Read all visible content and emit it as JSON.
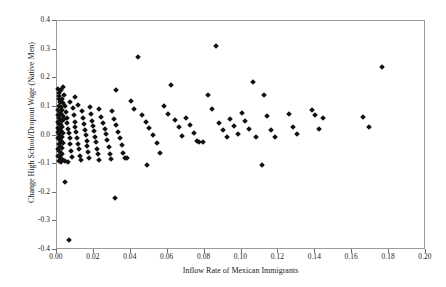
{
  "chart_data": {
    "type": "scatter",
    "title": "",
    "xlabel": "Inflow Rate of Mexican Immigrants",
    "ylabel": "Change High School/Dropout Wage (Native Men)",
    "xlim": [
      0.0,
      0.2
    ],
    "ylim": [
      -0.4,
      0.4
    ],
    "xticks": [
      0.0,
      0.02,
      0.04,
      0.06,
      0.08,
      0.1,
      0.12,
      0.14,
      0.16,
      0.18,
      0.2
    ],
    "xtick_labels": [
      "0.00",
      "0.02",
      "0.04",
      "0.06",
      "0.08",
      "0.10",
      "0.12",
      "0.14",
      "0.16",
      "0.18",
      "0.20"
    ],
    "yticks": [
      -0.4,
      -0.3,
      -0.2,
      -0.1,
      0.0,
      0.1,
      0.2,
      0.3,
      0.4
    ],
    "ytick_labels": [
      "-0.4",
      "-0.3",
      "-0.2",
      "-0.1",
      "0.0",
      "0.1",
      "0.2",
      "0.3",
      "0.4"
    ],
    "grid": false,
    "legend": null,
    "marker": "diamond",
    "marker_color": "#111111",
    "frame_color": "#9a9a9a",
    "series": [
      {
        "name": "metro areas",
        "points": [
          [
            0.0006,
            0.164
          ],
          [
            0.001,
            0.149
          ],
          [
            0.0013,
            0.137
          ],
          [
            0.0009,
            0.126
          ],
          [
            0.0016,
            0.118
          ],
          [
            0.0021,
            0.16
          ],
          [
            0.003,
            0.17
          ],
          [
            0.0026,
            0.128
          ],
          [
            0.0034,
            0.112
          ],
          [
            0.0012,
            0.104
          ],
          [
            0.0019,
            0.098
          ],
          [
            0.0028,
            0.09
          ],
          [
            0.0007,
            0.088
          ],
          [
            0.0015,
            0.08
          ],
          [
            0.0023,
            0.074
          ],
          [
            0.0032,
            0.068
          ],
          [
            0.0004,
            0.072
          ],
          [
            0.0011,
            0.062
          ],
          [
            0.0018,
            0.056
          ],
          [
            0.0025,
            0.05
          ],
          [
            0.0036,
            0.058
          ],
          [
            0.0005,
            0.046
          ],
          [
            0.0013,
            0.04
          ],
          [
            0.0021,
            0.035
          ],
          [
            0.0029,
            0.03
          ],
          [
            0.0008,
            0.026
          ],
          [
            0.0016,
            0.02
          ],
          [
            0.0024,
            0.015
          ],
          [
            0.0033,
            0.01
          ],
          [
            0.0003,
            0.012
          ],
          [
            0.001,
            0.005
          ],
          [
            0.0018,
            0.0
          ],
          [
            0.0027,
            -0.005
          ],
          [
            0.0006,
            -0.008
          ],
          [
            0.0014,
            -0.014
          ],
          [
            0.0022,
            -0.02
          ],
          [
            0.0031,
            -0.026
          ],
          [
            0.0009,
            -0.03
          ],
          [
            0.0017,
            -0.036
          ],
          [
            0.0026,
            -0.042
          ],
          [
            0.0004,
            -0.048
          ],
          [
            0.0012,
            -0.055
          ],
          [
            0.002,
            -0.06
          ],
          [
            0.0029,
            -0.066
          ],
          [
            0.0007,
            -0.07
          ],
          [
            0.0015,
            -0.076
          ],
          [
            0.0023,
            -0.082
          ],
          [
            0.0034,
            -0.086
          ],
          [
            0.0011,
            -0.09
          ],
          [
            0.0019,
            -0.094
          ],
          [
            0.004,
            0.142
          ],
          [
            0.0044,
            0.104
          ],
          [
            0.0048,
            0.082
          ],
          [
            0.0052,
            0.06
          ],
          [
            0.0056,
            0.044
          ],
          [
            0.006,
            0.024
          ],
          [
            0.0064,
            0.008
          ],
          [
            0.0068,
            -0.01
          ],
          [
            0.0072,
            -0.03
          ],
          [
            0.0076,
            -0.054
          ],
          [
            0.008,
            -0.074
          ],
          [
            0.0042,
            -0.088
          ],
          [
            0.0058,
            -0.092
          ],
          [
            0.007,
            0.118
          ],
          [
            0.0085,
            0.096
          ],
          [
            0.009,
            0.07
          ],
          [
            0.0095,
            0.048
          ],
          [
            0.01,
            0.03
          ],
          [
            0.0105,
            0.012
          ],
          [
            0.011,
            -0.008
          ],
          [
            0.0115,
            -0.028
          ],
          [
            0.012,
            -0.048
          ],
          [
            0.0125,
            -0.07
          ],
          [
            0.013,
            -0.086
          ],
          [
            0.0098,
            0.134
          ],
          [
            0.0112,
            0.108
          ],
          [
            0.0135,
            0.086
          ],
          [
            0.014,
            0.062
          ],
          [
            0.0145,
            0.04
          ],
          [
            0.015,
            0.02
          ],
          [
            0.0155,
            0.002
          ],
          [
            0.016,
            -0.018
          ],
          [
            0.0165,
            -0.038
          ],
          [
            0.017,
            -0.058
          ],
          [
            0.0175,
            -0.08
          ],
          [
            0.018,
            0.1
          ],
          [
            0.0185,
            0.074
          ],
          [
            0.019,
            0.052
          ],
          [
            0.0195,
            0.032
          ],
          [
            0.02,
            0.014
          ],
          [
            0.0205,
            -0.004
          ],
          [
            0.021,
            -0.024
          ],
          [
            0.0215,
            -0.046
          ],
          [
            0.022,
            -0.066
          ],
          [
            0.0225,
            -0.084
          ],
          [
            0.023,
            0.094
          ],
          [
            0.024,
            0.066
          ],
          [
            0.025,
            0.042
          ],
          [
            0.0258,
            0.022
          ],
          [
            0.0265,
            0.004
          ],
          [
            0.0272,
            -0.016
          ],
          [
            0.028,
            -0.04
          ],
          [
            0.0288,
            -0.064
          ],
          [
            0.0295,
            -0.082
          ],
          [
            0.03,
            0.086
          ],
          [
            0.031,
            0.058
          ],
          [
            0.032,
            0.036
          ],
          [
            0.033,
            0.012
          ],
          [
            0.034,
            -0.01
          ],
          [
            0.035,
            -0.034
          ],
          [
            0.036,
            -0.06
          ],
          [
            0.037,
            -0.078
          ],
          [
            0.0046,
            -0.163
          ],
          [
            0.0066,
            -0.365
          ],
          [
            0.0312,
            -0.218
          ],
          [
            0.0486,
            -0.103
          ],
          [
            0.044,
            0.276
          ],
          [
            0.032,
            0.158
          ],
          [
            0.04,
            0.12
          ],
          [
            0.042,
            0.092
          ],
          [
            0.046,
            0.07
          ],
          [
            0.048,
            0.048
          ],
          [
            0.05,
            0.026
          ],
          [
            0.052,
            0.002
          ],
          [
            0.054,
            -0.026
          ],
          [
            0.056,
            -0.062
          ],
          [
            0.038,
            -0.078
          ],
          [
            0.058,
            0.104
          ],
          [
            0.06,
            0.076
          ],
          [
            0.062,
            0.178
          ],
          [
            0.064,
            0.054
          ],
          [
            0.066,
            0.028
          ],
          [
            0.068,
            0.0
          ],
          [
            0.07,
            0.062
          ],
          [
            0.072,
            0.036
          ],
          [
            0.074,
            0.01
          ],
          [
            0.076,
            -0.02
          ],
          [
            0.077,
            -0.022
          ],
          [
            0.079,
            -0.022
          ],
          [
            0.082,
            0.142
          ],
          [
            0.086,
            0.311
          ],
          [
            0.084,
            0.094
          ],
          [
            0.088,
            0.044
          ],
          [
            0.09,
            0.02
          ],
          [
            0.092,
            -0.006
          ],
          [
            0.094,
            0.058
          ],
          [
            0.096,
            0.032
          ],
          [
            0.098,
            0.006
          ],
          [
            0.1,
            0.078
          ],
          [
            0.102,
            0.05
          ],
          [
            0.104,
            0.022
          ],
          [
            0.106,
            0.188
          ],
          [
            0.108,
            -0.006
          ],
          [
            0.111,
            -0.103
          ],
          [
            0.112,
            0.14
          ],
          [
            0.114,
            0.068
          ],
          [
            0.116,
            0.02
          ],
          [
            0.118,
            -0.004
          ],
          [
            0.126,
            0.074
          ],
          [
            0.128,
            0.03
          ],
          [
            0.13,
            0.004
          ],
          [
            0.138,
            0.09
          ],
          [
            0.14,
            0.07
          ],
          [
            0.142,
            0.022
          ],
          [
            0.144,
            0.062
          ],
          [
            0.166,
            0.064
          ],
          [
            0.169,
            0.028
          ],
          [
            0.176,
            0.238
          ]
        ]
      }
    ]
  }
}
